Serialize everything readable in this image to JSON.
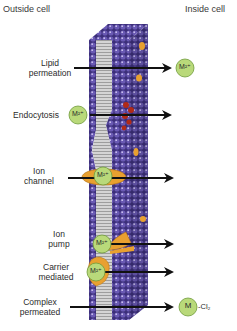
{
  "header": {
    "left": "Outside cell",
    "right": "Inside cell"
  },
  "mechanisms": [
    {
      "id": "lipid-permeation",
      "label_line1": "Lipid",
      "label_line2": "permeation",
      "ion": "M²⁺",
      "ion_side": "inside"
    },
    {
      "id": "endocytosis",
      "label_line1": "Endocytosis",
      "label_line2": "",
      "ion": "M²⁺",
      "ion_side": "outside"
    },
    {
      "id": "ion-channel",
      "label_line1": "Ion",
      "label_line2": "channel",
      "ion": "M²⁺",
      "ion_side": "membrane"
    },
    {
      "id": "ion-pump",
      "label_line1": "Ion",
      "label_line2": "pump",
      "ion": "M²⁺",
      "ion_side": "membrane"
    },
    {
      "id": "carrier-mediated",
      "label_line1": "Carrier",
      "label_line2": "mediated",
      "ion": "M²⁺",
      "ion_side": "membrane"
    },
    {
      "id": "complex-permeated",
      "label_line1": "Complex",
      "label_line2": "permeated",
      "ion": "M",
      "ion_suffix": "-Cl₂",
      "ion_side": "inside"
    }
  ],
  "colors": {
    "phospholipid_head": "#5a4aa0",
    "lipid_tail": "#b9b9b9",
    "protein": "#e8a030",
    "vesicle": "#b02a18",
    "ion_fill": "#b9d97a",
    "ion_stroke": "#6f9a3a",
    "arrow": "#111111"
  }
}
